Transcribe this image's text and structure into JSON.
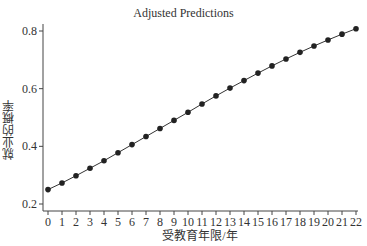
{
  "chart_data": {
    "type": "line",
    "title": "Adjusted Predictions",
    "xlabel": "受教育年限/年",
    "ylabel": "就业的概率",
    "x": [
      0,
      1,
      2,
      3,
      4,
      5,
      6,
      7,
      8,
      9,
      10,
      11,
      12,
      13,
      14,
      15,
      16,
      17,
      18,
      19,
      20,
      21,
      22
    ],
    "series": [
      {
        "name": "Predicted probability",
        "values": [
          0.25,
          0.273,
          0.298,
          0.324,
          0.35,
          0.378,
          0.406,
          0.434,
          0.462,
          0.49,
          0.518,
          0.547,
          0.575,
          0.602,
          0.628,
          0.654,
          0.679,
          0.703,
          0.726,
          0.748,
          0.769,
          0.789,
          0.808
        ],
        "marker": "circle",
        "color": "#222222"
      }
    ],
    "xticks": [
      "0",
      "1",
      "2",
      "3",
      "4",
      "5",
      "6",
      "7",
      "8",
      "9",
      "10",
      "11",
      "12",
      "13",
      "14",
      "15",
      "16",
      "17",
      "18",
      "19",
      "20",
      "21",
      "22"
    ],
    "yticks": [
      "0.2",
      "0.4",
      "0.6",
      "0.8"
    ],
    "ylim": [
      0.2,
      0.8
    ],
    "xlim": [
      0,
      22
    ],
    "grid": false,
    "legend": "none"
  }
}
